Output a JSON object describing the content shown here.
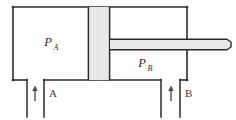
{
  "figure": {
    "type": "engineering-diagram",
    "background_color": "#ffffff",
    "line_color": "#2b2b2b",
    "fill_color": "#e9e9e9"
  },
  "chambers": [
    {
      "id": "chamber-a",
      "label": "P",
      "subscript": "A",
      "label_x": 50,
      "label_y": 45,
      "subscript_x": 58,
      "subscript_y": 48
    },
    {
      "id": "chamber-b",
      "label": "P",
      "subscript": "B",
      "label_x": 143,
      "label_y": 66,
      "subscript_x": 151,
      "subscript_y": 69
    }
  ],
  "ports": [
    {
      "id": "port-a",
      "label": "A",
      "label_x": 49,
      "label_y": 97,
      "arrow_x": 35,
      "arrow_top_y": 86,
      "arrow_bottom_y": 101,
      "direction": "up"
    },
    {
      "id": "port-b",
      "label": "B",
      "label_x": 185,
      "label_y": 97,
      "arrow_x": 171,
      "arrow_top_y": 86,
      "arrow_bottom_y": 101,
      "direction": "up"
    }
  ],
  "geometry": {
    "cylinder_left": 13,
    "cylinder_right": 187,
    "cylinder_top": 7,
    "cylinder_bottom": 80,
    "piston_left": 88,
    "piston_right": 110,
    "rod_top": 39,
    "rod_bottom": 50,
    "rod_right_end": 230,
    "port_a_left": 27,
    "port_a_right": 44,
    "port_b_left": 161,
    "port_b_right": 180,
    "port_bottom": 118
  },
  "colors": {
    "outline": "#2b2b2b",
    "hatch_fill": "#e9e9e9",
    "hatch_line": "#d2d2d2",
    "arrow": "#4a4a4a",
    "text": "#2b2b2b"
  }
}
